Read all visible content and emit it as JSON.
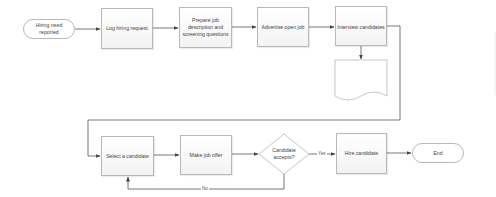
{
  "diagram": {
    "nodes": [
      {
        "id": "start",
        "type": "terminator",
        "label": "Hiring need reported"
      },
      {
        "id": "log",
        "type": "process",
        "label": "Log hiring request"
      },
      {
        "id": "prepare",
        "type": "process",
        "label": "Prepare job description and screening questions"
      },
      {
        "id": "advertise",
        "type": "process",
        "label": "Advertise open job"
      },
      {
        "id": "interview",
        "type": "process",
        "label": "Interview candidates"
      },
      {
        "id": "document",
        "type": "document",
        "label": ""
      },
      {
        "id": "select",
        "type": "process",
        "label": "Select a candidate"
      },
      {
        "id": "offer",
        "type": "process",
        "label": "Make job offer"
      },
      {
        "id": "accepts",
        "type": "decision",
        "label": "Candidate accepts?"
      },
      {
        "id": "hire",
        "type": "process",
        "label": "Hire candidate"
      },
      {
        "id": "end",
        "type": "terminator",
        "label": "End"
      }
    ],
    "edges": [
      {
        "from": "start",
        "to": "log",
        "label": ""
      },
      {
        "from": "log",
        "to": "prepare",
        "label": ""
      },
      {
        "from": "prepare",
        "to": "advertise",
        "label": ""
      },
      {
        "from": "advertise",
        "to": "interview",
        "label": ""
      },
      {
        "from": "interview",
        "to": "document",
        "label": ""
      },
      {
        "from": "interview",
        "to": "select",
        "label": ""
      },
      {
        "from": "select",
        "to": "offer",
        "label": ""
      },
      {
        "from": "offer",
        "to": "accepts",
        "label": ""
      },
      {
        "from": "accepts",
        "to": "hire",
        "label": "Yes"
      },
      {
        "from": "accepts",
        "to": "select",
        "label": "No"
      },
      {
        "from": "hire",
        "to": "end",
        "label": ""
      }
    ],
    "edge_labels": {
      "yes": "Yes",
      "no": "No"
    },
    "colors": {
      "line": "#555555",
      "border": "#b8b8b8",
      "text": "#444444"
    }
  }
}
